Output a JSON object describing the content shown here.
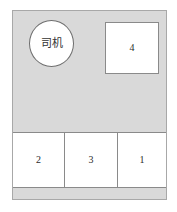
{
  "diagram": {
    "front_compartment": {
      "driver": {
        "label": "司机",
        "shape": "circle"
      },
      "front_passenger": {
        "label": "4",
        "shape": "square"
      }
    },
    "rear_row": {
      "seats": [
        {
          "label": "2"
        },
        {
          "label": "3"
        },
        {
          "label": "1"
        }
      ]
    },
    "colors": {
      "compartment_fill": "#d9d9d9",
      "seat_fill": "#ffffff",
      "outline": "#8a8a8a",
      "frame_outline": "#a8a8a8",
      "text": "#2b2b2b"
    }
  }
}
